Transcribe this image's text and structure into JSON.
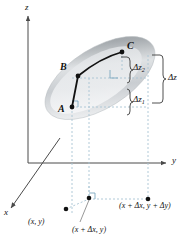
{
  "figure": {
    "type": "3d-calculus-diagram",
    "background_color": "#ffffff"
  },
  "axes": {
    "z_label": "z",
    "y_label": "y",
    "x_label": "x",
    "axis_color": "#4a4a4a",
    "origin": {
      "x": 28,
      "y": 163
    }
  },
  "surface": {
    "name": "elliptical-surface-patch",
    "fill_light": "#f2f3f4",
    "fill_mid": "#d7d9db",
    "fill_dark": "#a9adb1",
    "rotation_deg": -32
  },
  "points": [
    {
      "id": "A",
      "label": "A",
      "x": 72,
      "y": 107,
      "label_x": 58,
      "label_y": 104
    },
    {
      "id": "B",
      "label": "B",
      "x": 78,
      "y": 76,
      "label_x": 60,
      "label_y": 64
    },
    {
      "id": "C",
      "label": "C",
      "x": 122,
      "y": 52,
      "label_x": 127,
      "label_y": 43
    }
  ],
  "path": {
    "name": "curve-A-B-C",
    "color": "#111111",
    "segments": [
      "A-to-B",
      "B-to-C"
    ]
  },
  "increments": {
    "dz2": {
      "label_main": "Δz",
      "label_sub": "2",
      "x": 133,
      "y": 65
    },
    "dz1": {
      "label_main": "Δz",
      "label_sub": "1",
      "x": 133,
      "y": 97
    },
    "dz": {
      "label_main": "Δz",
      "label_sub": "",
      "x": 168,
      "y": 79
    },
    "bracket_color": "#3c3c3c"
  },
  "projection_labels": [
    {
      "id": "xy",
      "text": "(x, y)",
      "x": 40,
      "y": 219
    },
    {
      "id": "xdx_y",
      "text": "(x + Δx, y)",
      "x": 76,
      "y": 228
    },
    {
      "id": "xdx_ydy",
      "text": "(x + Δx, y + Δy)",
      "x": 119,
      "y": 203
    }
  ],
  "projection_points": [
    {
      "id": "p-xy",
      "x": 66,
      "y": 209
    },
    {
      "id": "p-xdx-y",
      "x": 88,
      "y": 198
    },
    {
      "id": "p-xdx-ydy",
      "x": 148,
      "y": 199
    }
  ],
  "guides": {
    "color": "#a8c4d4",
    "dash": "2,2",
    "right_angle_markers": [
      {
        "id": "ra-upper",
        "x": 110,
        "y": 70
      },
      {
        "id": "ra-lower",
        "x": 76,
        "y": 101
      },
      {
        "id": "ra-plane",
        "x": 89,
        "y": 199
      }
    ]
  }
}
